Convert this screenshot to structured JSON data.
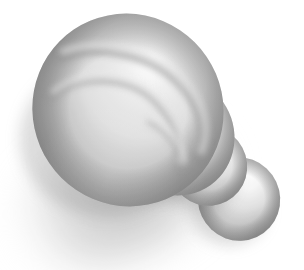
{
  "image": {
    "title": "Grayscale 3D Shell Render",
    "subject": "spiral shell form built from diminishing blended spheres",
    "alt_text": "Grayscale rendering of a snail-shell-like object made of blended spheres, lit from upper right, casting a soft shadow to the lower left on a white background.",
    "width": 304,
    "height": 270,
    "background_color": "#ffffff",
    "rendering_style": "halftone dithered grayscale bitmap",
    "light_direction": "upper-right",
    "shadow_direction": "lower-left"
  },
  "palette": {
    "background": "#ffffff",
    "highlight": "#f2f2f2",
    "light_gray": "#dcdcdc",
    "mid_gray": "#b4b4b4",
    "body_gray": "#9b9b9b",
    "dark_gray": "#7a7a7a",
    "deep_shadow": "#606060",
    "terminator": "#8a8a8a",
    "cast_shadow": "#c9c9c9"
  },
  "geometry": {
    "whorls": [
      {
        "name": "body-whorl",
        "center_x": 128,
        "center_y": 110,
        "radius_x": 95,
        "radius_y": 97,
        "rotation_deg": -34,
        "highlight_x": 152,
        "highlight_y": 62,
        "fill_light": "#ececec",
        "fill_dark": "#6e6e6e"
      },
      {
        "name": "second-whorl",
        "center_x": 176,
        "center_y": 136,
        "radius_x": 58,
        "radius_y": 60,
        "rotation_deg": -30,
        "highlight_x": 190,
        "highlight_y": 106,
        "fill_light": "#f0f0f0",
        "fill_dark": "#8e8e8e"
      },
      {
        "name": "third-whorl",
        "center_x": 208,
        "center_y": 166,
        "radius_x": 39,
        "radius_y": 40,
        "rotation_deg": -28,
        "highlight_x": 218,
        "highlight_y": 146,
        "fill_light": "#f2f2f2",
        "fill_dark": "#989898",
        "label": "knob"
      },
      {
        "name": "apex-whorl",
        "center_x": 239,
        "center_y": 199,
        "radius_x": 41,
        "radius_y": 42,
        "rotation_deg": -25,
        "highlight_x": 249,
        "highlight_y": 175,
        "fill_light": "#f4f4f4",
        "fill_dark": "#9c9c9c",
        "label": "apex"
      }
    ],
    "spiral_grooves": [
      {
        "name": "outer-groove",
        "path": "M 62 56 C 96 44 150 52 180 84 C 205 110 208 136 200 156",
        "width": 9,
        "shade": "#7d7d7d"
      },
      {
        "name": "inner-groove",
        "path": "M 52 96 C 80 74 130 74 158 104 C 180 128 184 150 178 166",
        "width": 7,
        "shade": "#8b8b8b"
      },
      {
        "name": "seam-groove",
        "path": "M 150 122 C 168 132 180 148 183 166",
        "width": 6,
        "shade": "#9a9a9a"
      }
    ],
    "cast_shadow": {
      "name": "ground-shadow",
      "center_x": 120,
      "center_y": 196,
      "radius_x": 118,
      "radius_y": 62,
      "rotation_deg": -22,
      "color": "#bfbfbf",
      "blur": 18
    }
  }
}
